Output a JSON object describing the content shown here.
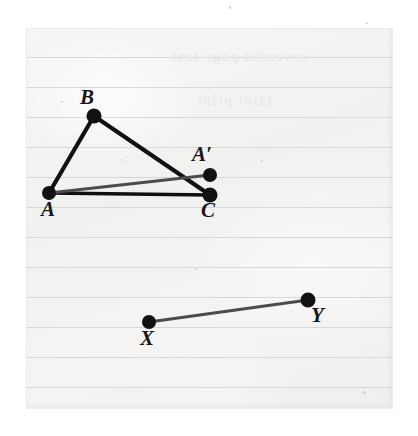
{
  "figure": {
    "paper": {
      "background_color": "#f3f3f2",
      "border_color": "#e2e2e0",
      "rule_color": "#cfd3d6",
      "rule_spacing": 30,
      "rule_positions": [
        57,
        87,
        117,
        147,
        177,
        207,
        237,
        267,
        297,
        327,
        357,
        387
      ],
      "showthrough_lines": [
        {
          "text": "reversed page text",
          "left": 170,
          "top": 48
        },
        {
          "text": "faint print",
          "left": 196,
          "top": 92
        }
      ]
    },
    "colors": {
      "segment_dark": "#111111",
      "segment_gray": "#4c4c4c",
      "vertex": "#111111",
      "label": "#171717"
    },
    "points": [
      {
        "id": "A",
        "label": "A",
        "x": 49,
        "y": 193,
        "r": 7,
        "label_x": 41,
        "label_y": 199
      },
      {
        "id": "B",
        "label": "B",
        "x": 94,
        "y": 116,
        "r": 7.5,
        "label_x": 80,
        "label_y": 87
      },
      {
        "id": "Ap",
        "label": "A′",
        "x": 210,
        "y": 175,
        "r": 7,
        "label_x": 192,
        "label_y": 144
      },
      {
        "id": "C",
        "label": "C",
        "x": 210,
        "y": 195,
        "r": 7.5,
        "label_x": 201,
        "label_y": 200
      },
      {
        "id": "X",
        "label": "X",
        "x": 149,
        "y": 322,
        "r": 7,
        "label_x": 140,
        "label_y": 328
      },
      {
        "id": "Y",
        "label": "Y",
        "x": 308,
        "y": 300,
        "r": 7.5,
        "label_x": 311,
        "label_y": 305
      }
    ],
    "segments": [
      {
        "id": "AB",
        "from": "A",
        "to": "B",
        "style": "dark",
        "width": 4.2
      },
      {
        "id": "BC",
        "from": "B",
        "to": "C",
        "style": "dark",
        "width": 4.2
      },
      {
        "id": "AC",
        "from": "A",
        "to": "C",
        "style": "dark",
        "width": 3.4
      },
      {
        "id": "AAp",
        "from": "A",
        "to": "Ap",
        "style": "gray",
        "width": 3.2
      },
      {
        "id": "XY",
        "from": "X",
        "to": "Y",
        "style": "gray",
        "width": 3.2
      }
    ],
    "specks": [
      {
        "x": 229,
        "y": 6,
        "w": 2,
        "h": 3
      },
      {
        "x": 366,
        "y": 22,
        "w": 2,
        "h": 2
      },
      {
        "x": 61,
        "y": 101,
        "w": 2,
        "h": 2
      },
      {
        "x": 121,
        "y": 159,
        "w": 2,
        "h": 2
      },
      {
        "x": 261,
        "y": 160,
        "w": 2,
        "h": 2
      },
      {
        "x": 195,
        "y": 268,
        "w": 2,
        "h": 2
      },
      {
        "x": 363,
        "y": 391,
        "w": 3,
        "h": 3
      }
    ]
  }
}
